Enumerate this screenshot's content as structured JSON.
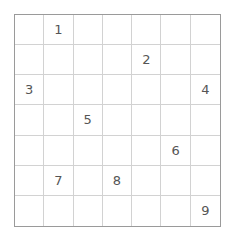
{
  "puzzle": {
    "type": "number-grid",
    "rows": 7,
    "columns": 7,
    "border_color": "#9a9a9a",
    "gridline_color": "#d2d2d2",
    "digit_color": "#555555",
    "background_color": "#ffffff",
    "cells": [
      [
        "",
        "1",
        "",
        "",
        "",
        "",
        ""
      ],
      [
        "",
        "",
        "",
        "",
        "2",
        "",
        ""
      ],
      [
        "3",
        "",
        "",
        "",
        "",
        "",
        "4"
      ],
      [
        "",
        "",
        "5",
        "",
        "",
        "",
        ""
      ],
      [
        "",
        "",
        "",
        "",
        "",
        "6",
        ""
      ],
      [
        "",
        "7",
        "",
        "8",
        "",
        "",
        ""
      ],
      [
        "",
        "",
        "",
        "",
        "",
        "",
        "9"
      ]
    ]
  }
}
